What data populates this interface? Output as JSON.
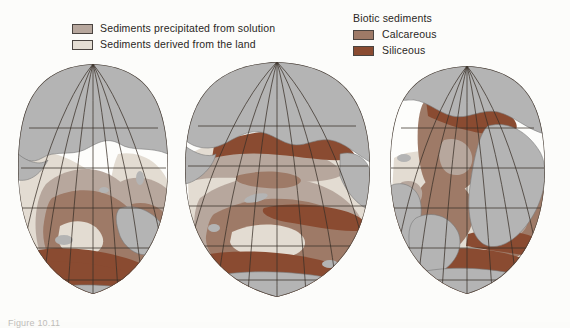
{
  "figure": {
    "caption": "Figure 10.11",
    "background_color": "#fcfcfa"
  },
  "legend": {
    "left_column": {
      "items": [
        {
          "swatch_name": "swatch-precipitated",
          "color": "#b7a79d",
          "label": "Sediments precipitated from solution"
        },
        {
          "swatch_name": "swatch-terrigenous",
          "color": "#e4ddd3",
          "label": "Sediments derived from the land"
        }
      ]
    },
    "right_column": {
      "heading": "Biotic sediments",
      "items": [
        {
          "swatch_name": "swatch-calcareous",
          "color": "#9e7a67",
          "label": "Calcareous"
        },
        {
          "swatch_name": "swatch-siliceous",
          "color": "#8a4b31",
          "label": "Siliceous"
        }
      ]
    }
  },
  "map": {
    "projection": "interrupted homolosine (Goode) — three ocean-centered lobes",
    "lobes": [
      {
        "name": "pacific-west-lobe",
        "center_longitude": "160°E"
      },
      {
        "name": "pacific-east-lobe",
        "center_longitude": "120°W"
      },
      {
        "name": "atlantic-indian-lobe",
        "center_longitude": "20°W"
      }
    ],
    "colors": {
      "land": "#b4b4b4",
      "land_outline": "#6f6f6f",
      "terrigenous": "#e3dcd2",
      "precipitated": "#b7a79d",
      "calcareous": "#9e7a67",
      "siliceous": "#8a4b31",
      "ocean_blank": "#fdfdfb",
      "graticule": "#3a3028",
      "lobe_outline": "#4a4038"
    },
    "graticule": {
      "parallel_interval_degrees": 20,
      "meridian_interval_degrees": 20,
      "visible": true
    }
  }
}
